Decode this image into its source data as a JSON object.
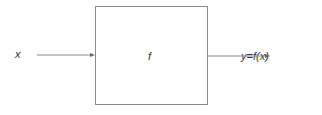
{
  "diagram": {
    "input_label": "x",
    "function_label": "f",
    "output_label": "y=f(x)",
    "colors": {
      "line": "#8a8a8a",
      "text": "#333333"
    }
  }
}
